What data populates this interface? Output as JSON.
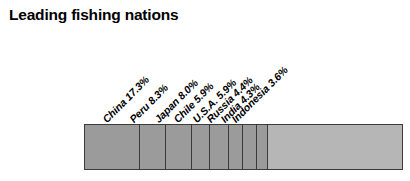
{
  "chart": {
    "title": "Leading fishing nations"
  },
  "chart_data": {
    "type": "bar",
    "orientation": "horizontal-stacked",
    "title": "Leading fishing nations",
    "xlabel": "",
    "ylabel": "",
    "grid": false,
    "legend": "none",
    "value_unit": "%",
    "xlim": [
      0,
      100
    ],
    "categories": [
      "China",
      "Peru",
      "Japan",
      "Chile",
      "U.S.A.",
      "Russia",
      "India",
      "Indonesia",
      "Others"
    ],
    "values": [
      17.3,
      8.3,
      8.0,
      5.9,
      5.9,
      4.4,
      4.3,
      3.6,
      42.3
    ],
    "labels": [
      "China 17.3%",
      "Peru 8.3%",
      "Japan 8.0%",
      "Chile 5.9%",
      "U.S.A. 5.9%",
      "Russia 4.4%",
      "India 4.3%",
      "Indonesia 3.6%"
    ],
    "segments": [
      {
        "name": "China",
        "label": "China 17.3%",
        "value": 17.3,
        "color": "#9b9b9b"
      },
      {
        "name": "Peru",
        "label": "Peru 8.3%",
        "value": 8.3,
        "color": "#9b9b9b"
      },
      {
        "name": "Japan",
        "label": "Japan 8.0%",
        "value": 8.0,
        "color": "#9b9b9b"
      },
      {
        "name": "Chile",
        "label": "Chile 5.9%",
        "value": 5.9,
        "color": "#9b9b9b"
      },
      {
        "name": "U.S.A.",
        "label": "U.S.A. 5.9%",
        "value": 5.9,
        "color": "#9b9b9b"
      },
      {
        "name": "Russia",
        "label": "Russia 4.4%",
        "value": 4.4,
        "color": "#9b9b9b"
      },
      {
        "name": "India",
        "label": "India 4.3%",
        "value": 4.3,
        "color": "#9b9b9b"
      },
      {
        "name": "Indonesia",
        "label": "Indonesia 3.6%",
        "value": 3.6,
        "color": "#9b9b9b"
      },
      {
        "name": "Others",
        "label": "",
        "value": 42.3,
        "color": "#b6b6b6"
      }
    ],
    "colors": {
      "named_segment_fill": "#9b9b9b",
      "others_fill": "#b6b6b6",
      "outline": "#3b3b3b",
      "text": "#000000",
      "background": "#ffffff"
    },
    "label_rotation_deg": -45
  }
}
